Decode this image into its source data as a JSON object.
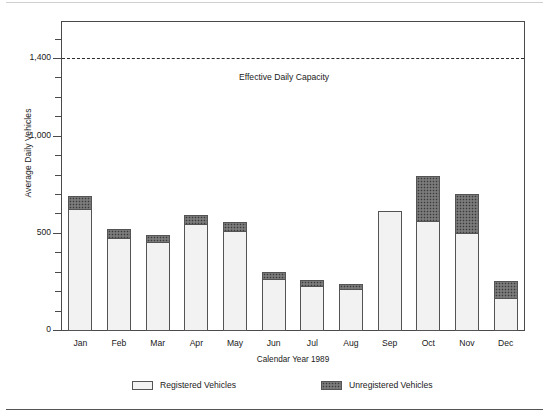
{
  "chart_data": {
    "type": "bar",
    "stacked": true,
    "title": "",
    "xlabel": "Calendar Year 1989",
    "ylabel": "Average Daily Vehicles",
    "categories": [
      "Jan",
      "Feb",
      "Mar",
      "Apr",
      "May",
      "Jun",
      "Jul",
      "Aug",
      "Sep",
      "Oct",
      "Nov",
      "Dec"
    ],
    "series": [
      {
        "name": "Registered Vehicles",
        "values": [
          628,
          479,
          458,
          551,
          515,
          268,
          232,
          216,
          618,
          566,
          504,
          170
        ]
      },
      {
        "name": "Unregistered Vehicles",
        "values": [
          67,
          46,
          36,
          46,
          46,
          36,
          30,
          26,
          0,
          232,
          201,
          87
        ]
      }
    ],
    "totals": [
      695,
      525,
      494,
      597,
      561,
      304,
      262,
      242,
      618,
      798,
      705,
      257
    ],
    "ylim": [
      0,
      1500
    ],
    "ytick_values": [
      0,
      100,
      200,
      300,
      400,
      500,
      600,
      700,
      800,
      900,
      1000,
      1100,
      1200,
      1300,
      1400,
      1500
    ],
    "ytick_labels": [
      {
        "value": 0,
        "label": "0"
      },
      {
        "value": 500,
        "label": "500"
      },
      {
        "value": 1000,
        "label": "1,000"
      },
      {
        "value": 1400,
        "label": "1,400"
      }
    ],
    "grid": false,
    "legend_position": "bottom",
    "annotations": [
      {
        "name": "effective-daily-capacity",
        "label": "Effective Daily Capacity",
        "value": 1400,
        "style": "dashed-horizontal-line"
      }
    ],
    "colors": {
      "registered_fill": "#f2f2f2",
      "registered_pattern": "#9a9a9a",
      "unregistered_fill": "#6d6d6d",
      "bar_outline": "#545454",
      "axis": "#4a4a4a",
      "text": "#1a1a1a"
    }
  },
  "axes": {
    "y_title": "Average Daily Vehicles",
    "x_title": "Calendar Year 1989"
  },
  "capacity": {
    "label": "Effective Daily Capacity"
  },
  "legend": {
    "registered_label": "Registered Vehicles",
    "unregistered_label": "Unregistered Vehicles"
  }
}
